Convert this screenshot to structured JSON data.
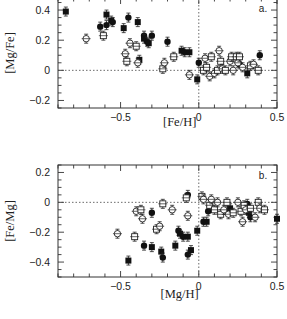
{
  "chart_data": [
    {
      "type": "scatter",
      "panel": "a.",
      "title": "",
      "xlabel": "[Fe/H]",
      "ylabel": "[Mg/Fe]",
      "xlim": [
        -0.9,
        0.5
      ],
      "ylim": [
        -0.25,
        0.48
      ],
      "xticks": [
        -0.5,
        0,
        0.5
      ],
      "xtick_labels": [
        "-0.5",
        "0",
        "0.5"
      ],
      "yticks": [
        -0.2,
        0,
        0.2,
        0.4
      ],
      "ytick_labels": [
        "-0.2",
        "0",
        "0.2",
        "0.4"
      ],
      "grid": false,
      "reference_lines": {
        "x": 0,
        "y": 0,
        "style": "dotted"
      },
      "series": [
        {
          "name": "filled",
          "marker": "filled",
          "points": [
            [
              -0.85,
              0.39
            ],
            [
              -0.63,
              0.29
            ],
            [
              -0.59,
              0.37
            ],
            [
              -0.59,
              0.3
            ],
            [
              -0.56,
              0.33
            ],
            [
              -0.55,
              0.32
            ],
            [
              -0.48,
              0.28
            ],
            [
              -0.45,
              0.35
            ],
            [
              -0.39,
              0.32
            ],
            [
              -0.35,
              0.23
            ],
            [
              -0.35,
              0.21
            ],
            [
              -0.33,
              0.19
            ],
            [
              -0.32,
              0.18
            ],
            [
              -0.3,
              0.23
            ],
            [
              -0.38,
              0.07
            ],
            [
              -0.2,
              0.19
            ],
            [
              -0.11,
              0.13
            ],
            [
              -0.09,
              0.12
            ],
            [
              -0.06,
              0.12
            ],
            [
              0.0,
              0.05
            ],
            [
              -0.01,
              -0.06
            ],
            [
              0.26,
              0.04
            ],
            [
              0.31,
              -0.02
            ],
            [
              0.39,
              0.1
            ]
          ]
        },
        {
          "name": "open",
          "marker": "open",
          "points": [
            [
              -0.72,
              0.21
            ],
            [
              -0.61,
              0.23
            ],
            [
              -0.47,
              0.11
            ],
            [
              -0.46,
              0.06
            ],
            [
              -0.44,
              0.18
            ],
            [
              -0.4,
              0.16
            ],
            [
              -0.39,
              0.05
            ],
            [
              -0.23,
              0.01
            ],
            [
              -0.22,
              0.05
            ],
            [
              -0.16,
              0.09
            ],
            [
              -0.06,
              -0.03
            ],
            [
              0.03,
              0.0
            ],
            [
              0.04,
              0.08
            ],
            [
              0.05,
              0.02
            ],
            [
              0.07,
              -0.04
            ],
            [
              0.08,
              0.09
            ],
            [
              0.1,
              -0.02
            ],
            [
              0.12,
              0.0
            ],
            [
              0.13,
              0.13
            ],
            [
              0.14,
              0.06
            ],
            [
              0.15,
              0.01
            ],
            [
              0.17,
              0.0
            ],
            [
              0.2,
              0.06
            ],
            [
              0.21,
              0.09
            ],
            [
              0.22,
              0.0
            ],
            [
              0.24,
              0.09
            ],
            [
              0.25,
              0.05
            ],
            [
              0.26,
              0.09
            ],
            [
              0.28,
              0.02
            ],
            [
              0.33,
              0.03
            ],
            [
              0.35,
              0.04
            ],
            [
              0.38,
              0.0
            ]
          ]
        }
      ]
    },
    {
      "type": "scatter",
      "panel": "b.",
      "title": "",
      "xlabel": "[Mg/H]",
      "ylabel": "[Fe/Mg]",
      "xlim": [
        -0.9,
        0.5
      ],
      "ylim": [
        -0.5,
        0.25
      ],
      "xticks": [
        -0.5,
        0,
        0.5
      ],
      "xtick_labels": [
        "-0.5",
        "0",
        "0.5"
      ],
      "yticks": [
        -0.4,
        -0.2,
        0,
        0.2
      ],
      "ytick_labels": [
        "-0.4",
        "-0.2",
        "0",
        "0.2"
      ],
      "grid": false,
      "reference_lines": {
        "x": 0,
        "y": 0,
        "style": "dotted"
      },
      "series": [
        {
          "name": "filled",
          "marker": "filled",
          "points": [
            [
              -0.45,
              -0.39
            ],
            [
              -0.35,
              -0.29
            ],
            [
              -0.3,
              -0.3
            ],
            [
              -0.3,
              -0.07
            ],
            [
              -0.24,
              -0.33
            ],
            [
              -0.23,
              -0.37
            ],
            [
              -0.15,
              -0.29
            ],
            [
              -0.13,
              -0.19
            ],
            [
              -0.12,
              -0.21
            ],
            [
              -0.1,
              -0.23
            ],
            [
              -0.07,
              -0.23
            ],
            [
              -0.07,
              -0.35
            ],
            [
              -0.05,
              -0.32
            ],
            [
              -0.07,
              0.05
            ],
            [
              -0.01,
              -0.19
            ],
            [
              0.03,
              -0.13
            ],
            [
              0.05,
              -0.13
            ],
            [
              0.06,
              -0.06
            ],
            [
              0.2,
              -0.04
            ],
            [
              0.31,
              -0.01
            ],
            [
              0.32,
              -0.07
            ],
            [
              0.33,
              -0.1
            ],
            [
              0.5,
              -0.11
            ]
          ]
        },
        {
          "name": "open",
          "marker": "open",
          "points": [
            [
              -0.52,
              -0.21
            ],
            [
              -0.41,
              -0.23
            ],
            [
              -0.4,
              -0.06
            ],
            [
              -0.37,
              -0.05
            ],
            [
              -0.36,
              -0.11
            ],
            [
              -0.27,
              -0.18
            ],
            [
              -0.25,
              -0.16
            ],
            [
              -0.23,
              -0.01
            ],
            [
              -0.17,
              -0.05
            ],
            [
              -0.08,
              0.03
            ],
            [
              -0.07,
              -0.09
            ],
            [
              0.02,
              0.04
            ],
            [
              0.03,
              0.02
            ],
            [
              0.07,
              -0.02
            ],
            [
              0.08,
              0.02
            ],
            [
              0.1,
              -0.05
            ],
            [
              0.12,
              0.0
            ],
            [
              0.14,
              -0.08
            ],
            [
              0.16,
              -0.05
            ],
            [
              0.18,
              0.0
            ],
            [
              0.19,
              -0.08
            ],
            [
              0.22,
              -0.07
            ],
            [
              0.25,
              0.0
            ],
            [
              0.27,
              -0.06
            ],
            [
              0.28,
              -0.13
            ],
            [
              0.29,
              -0.02
            ],
            [
              0.3,
              -0.05
            ],
            [
              0.33,
              -0.04
            ],
            [
              0.36,
              -0.1
            ],
            [
              0.38,
              0.0
            ],
            [
              0.39,
              -0.04
            ],
            [
              0.42,
              -0.05
            ]
          ]
        }
      ]
    }
  ]
}
